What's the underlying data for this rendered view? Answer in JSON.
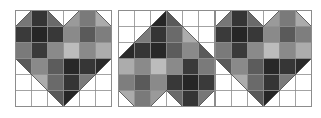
{
  "figure": {
    "grid_size": 6,
    "outline_color": "#8c8c8c",
    "background": "#ffffff"
  },
  "heart_shape_polygon": [
    [
      0,
      1
    ],
    [
      1,
      0
    ],
    [
      2,
      0
    ],
    [
      3,
      1
    ],
    [
      4,
      0
    ],
    [
      5,
      0
    ],
    [
      6,
      1
    ],
    [
      6,
      3
    ],
    [
      3,
      6
    ],
    [
      0,
      3
    ]
  ],
  "shades": [
    [
      "#777777",
      "#353535",
      "#6a6a6a",
      "#9a9a9a",
      "#7a7a7a",
      "#ababab"
    ],
    [
      "#3a3a3a",
      "#262626",
      "#383838",
      "#8a8a8a",
      "#5a5a5a",
      "#7e7e7e"
    ],
    [
      "#7a7a7a",
      "#3a3a3a",
      "#8a8a8a",
      "#bcbcbc",
      "#8a8a8a",
      "#acacac"
    ],
    [
      "#5a5a5a",
      "#8a8a8a",
      "#5c5c5c",
      "#282828",
      "#363636",
      "#2a2a2a"
    ],
    [
      "#ffffff",
      "#acacac",
      "#6a6a6a",
      "#353535",
      "#7a7a7a",
      "#ffffff"
    ],
    [
      "#ffffff",
      "#ffffff",
      "#5a5a5a",
      "#262626",
      "#ffffff",
      "#ffffff"
    ]
  ],
  "panels": [
    {
      "id": "heart-1",
      "x": 15,
      "rotation": 0
    },
    {
      "id": "heart-2",
      "x": 118,
      "rotation": 180
    },
    {
      "id": "heart-3",
      "x": 215,
      "rotation": 0
    }
  ]
}
